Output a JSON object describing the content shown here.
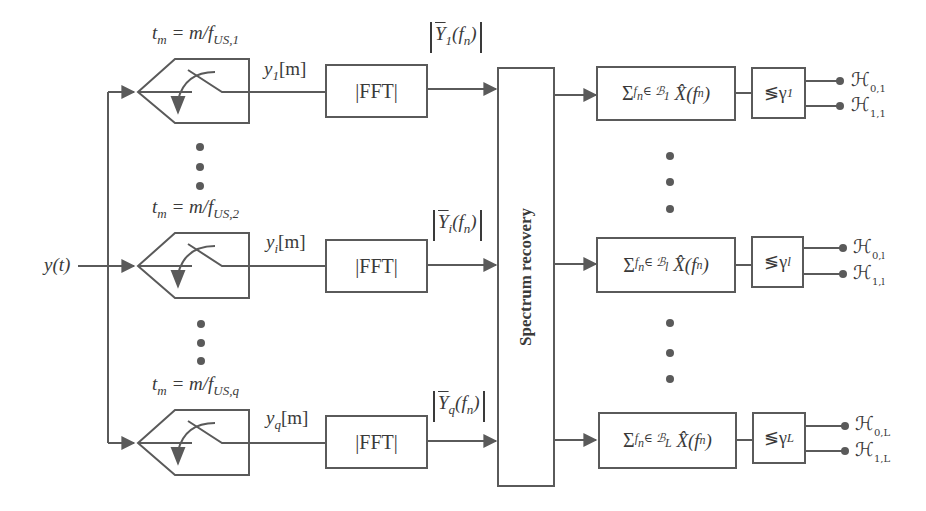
{
  "diagram": {
    "input": {
      "label": "y(t)"
    },
    "branches": [
      {
        "sampler_time": "t",
        "sampler_time_sub": "m",
        "sampler_rate": "= m/f",
        "sampler_rate_sub": "US,1",
        "output": "y",
        "output_sub": "1",
        "output_idx": "[m]",
        "fft_label": "|FFT|",
        "fft_out": "Y",
        "fft_out_sub": "1",
        "fft_out_arg": "(f",
        "fft_out_arg_sub": "n",
        "fft_out_close": ")"
      },
      {
        "sampler_time": "t",
        "sampler_time_sub": "m",
        "sampler_rate": "= m/f",
        "sampler_rate_sub": "US,2",
        "output": "y",
        "output_sub": "i",
        "output_idx": "[m]",
        "fft_label": "|FFT|",
        "fft_out": "Y",
        "fft_out_sub": "i",
        "fft_out_arg": "(f",
        "fft_out_arg_sub": "n",
        "fft_out_close": ")"
      },
      {
        "sampler_time": "t",
        "sampler_time_sub": "m",
        "sampler_rate": "= m/f",
        "sampler_rate_sub": "US,q",
        "output": "y",
        "output_sub": "q",
        "output_idx": "[m]",
        "fft_label": "|FFT|",
        "fft_out": "Y",
        "fft_out_sub": "q",
        "fft_out_arg": "(f",
        "fft_out_arg_sub": "n",
        "fft_out_close": ")"
      }
    ],
    "spectrum_recovery": {
      "label": "Spectrum recovery"
    },
    "detectors": [
      {
        "sum_symbol": "Σ",
        "sum_sub": "f",
        "sum_sub_n": "n",
        "sum_set": "∈ ℬ",
        "sum_set_sub": "1",
        "sum_term": "X̂(f",
        "sum_term_sub": "n",
        "sum_term_close": ")",
        "threshold": "≶γ",
        "threshold_sub": "1",
        "h0": "ℋ",
        "h0_sub": "0,1",
        "h1": "ℋ",
        "h1_sub": "1,1"
      },
      {
        "sum_symbol": "Σ",
        "sum_sub": "f",
        "sum_sub_n": "n",
        "sum_set": "∈ ℬ",
        "sum_set_sub": "l",
        "sum_term": "X̂(f",
        "sum_term_sub": "n",
        "sum_term_close": ")",
        "threshold": "≶γ",
        "threshold_sub": "l",
        "h0": "ℋ",
        "h0_sub": "0,l",
        "h1": "ℋ",
        "h1_sub": "1,l"
      },
      {
        "sum_symbol": "Σ",
        "sum_sub": "f",
        "sum_sub_n": "n",
        "sum_set": "∈ ℬ",
        "sum_set_sub": "L",
        "sum_term": "X̂(f",
        "sum_term_sub": "n",
        "sum_term_close": ")",
        "threshold": "≶γ",
        "threshold_sub": "L",
        "h0": "ℋ",
        "h0_sub": "0,L",
        "h1": "ℋ",
        "h1_sub": "1,L"
      }
    ],
    "colors": {
      "line": "#5a5a5a",
      "text": "#3a3a3a",
      "background": "#ffffff"
    }
  }
}
